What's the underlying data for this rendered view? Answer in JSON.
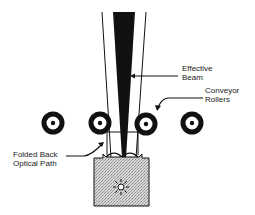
{
  "diagram": {
    "labels": {
      "effective_beam_line1": "Effective",
      "effective_beam_line2": "Beam",
      "conveyor_rollers_line1": "Conveyor",
      "conveyor_rollers_line2": "Rollers",
      "folded_path_line1": "Folded Back",
      "folded_path_line2": "Optical Path"
    },
    "colors": {
      "ink": "#111111",
      "housing_fill": "#cfcfcf",
      "background": "#ffffff"
    },
    "elements": [
      {
        "name": "effective-beam",
        "shape": "tapered-black-wedge"
      },
      {
        "name": "outer-beam-lines",
        "shape": "diverging-lines"
      },
      {
        "name": "conveyor-roller",
        "count": 4,
        "shape": "ring-with-dot"
      },
      {
        "name": "scanner-housing",
        "shape": "stippled-box"
      },
      {
        "name": "light-source",
        "shape": "starburst"
      }
    ]
  }
}
